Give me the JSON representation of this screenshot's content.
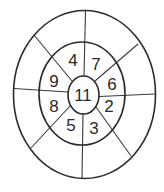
{
  "diagram": {
    "type": "concentric-ring-number-puzzle",
    "rings": {
      "outer": {
        "cx": 84.5,
        "cy": 94.5,
        "rx": 71,
        "ry": 84
      },
      "middle": {
        "cx": 82,
        "cy": 93.5,
        "rx": 43,
        "ry": 51.5
      },
      "inner": {
        "cx": 83.5,
        "cy": 95,
        "rx": 15.5,
        "ry": 19
      }
    },
    "center": {
      "label": "11",
      "x": 83,
      "y": 95
    },
    "middle_ring_numbers": [
      {
        "position": "top-left",
        "label": "4",
        "x": 73,
        "y": 60
      },
      {
        "position": "top-right",
        "label": "7",
        "x": 96,
        "y": 64
      },
      {
        "position": "right-upper",
        "label": "6",
        "x": 112,
        "y": 84
      },
      {
        "position": "right-lower",
        "label": "2",
        "x": 109,
        "y": 106
      },
      {
        "position": "bottom-right",
        "label": "3",
        "x": 94,
        "y": 128
      },
      {
        "position": "bottom-left",
        "label": "5",
        "x": 71,
        "y": 125
      },
      {
        "position": "left-lower",
        "label": "8",
        "x": 54,
        "y": 106
      },
      {
        "position": "left-upper",
        "label": "9",
        "x": 54,
        "y": 81
      }
    ],
    "outer_ring_numbers": [],
    "spokes": [
      {
        "name": "top",
        "x1": 84,
        "y1": 76,
        "x2": 85.5,
        "y2": 11
      },
      {
        "name": "top-right",
        "x1": 95,
        "y1": 81,
        "x2": 138,
        "y2": 44
      },
      {
        "name": "right",
        "x1": 99,
        "y1": 96.5,
        "x2": 155,
        "y2": 94
      },
      {
        "name": "bottom-right",
        "x1": 96,
        "y1": 107,
        "x2": 131,
        "y2": 156
      },
      {
        "name": "bottom",
        "x1": 83,
        "y1": 114,
        "x2": 82,
        "y2": 178
      },
      {
        "name": "bottom-left",
        "x1": 71,
        "y1": 105,
        "x2": 31,
        "y2": 148
      },
      {
        "name": "left",
        "x1": 68,
        "y1": 92,
        "x2": 14,
        "y2": 88.5
      },
      {
        "name": "top-left",
        "x1": 72,
        "y1": 81,
        "x2": 34,
        "y2": 35
      }
    ],
    "colors": {
      "line": "#2b2b2b",
      "text": "#2a2a2a",
      "background": "#ffffff"
    }
  }
}
